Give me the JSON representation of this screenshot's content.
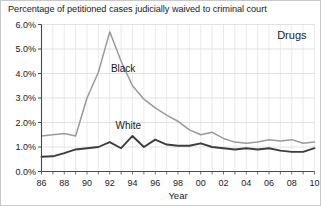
{
  "chart_data": {
    "type": "line",
    "title": "Percentage of petitioned cases judicially waived to criminal court",
    "panel_label": "Drugs",
    "xlabel": "Year",
    "ylabel": "",
    "xlim": [
      1986,
      2010
    ],
    "ylim": [
      0.0,
      6.0
    ],
    "ytick_values": [
      0.0,
      1.0,
      2.0,
      3.0,
      4.0,
      5.0,
      6.0
    ],
    "ytick_labels": [
      "0.0%",
      "1.0%",
      "2.0%",
      "3.0%",
      "4.0%",
      "5.0%",
      "6.0%"
    ],
    "xtick_values": [
      1986,
      1988,
      1990,
      1992,
      1994,
      1996,
      1998,
      2000,
      2002,
      2004,
      2006,
      2008,
      2010
    ],
    "xtick_labels": [
      "86",
      "88",
      "90",
      "92",
      "94",
      "96",
      "98",
      "00",
      "02",
      "04",
      "06",
      "08",
      "10"
    ],
    "minor_xticks_every": 1,
    "grid": true,
    "legend": "inline-annotations",
    "x": [
      1986,
      1987,
      1988,
      1989,
      1990,
      1991,
      1992,
      1993,
      1994,
      1995,
      1996,
      1997,
      1998,
      1999,
      2000,
      2001,
      2002,
      2003,
      2004,
      2005,
      2006,
      2007,
      2008,
      2009,
      2010
    ],
    "series": [
      {
        "name": "Black",
        "color": "#9a9a9a",
        "label_x": 1992.1,
        "label_y": 4.05,
        "values": [
          1.45,
          1.5,
          1.55,
          1.45,
          3.0,
          4.05,
          5.7,
          4.5,
          3.5,
          2.95,
          2.6,
          2.3,
          2.05,
          1.7,
          1.5,
          1.6,
          1.35,
          1.2,
          1.15,
          1.2,
          1.3,
          1.25,
          1.3,
          1.15,
          1.2
        ]
      },
      {
        "name": "White",
        "color": "#3d3d3d",
        "label_x": 1992.5,
        "label_y": 1.72,
        "values": [
          0.6,
          0.62,
          0.75,
          0.9,
          0.95,
          1.0,
          1.2,
          0.95,
          1.45,
          1.0,
          1.3,
          1.1,
          1.05,
          1.05,
          1.15,
          1.0,
          0.95,
          0.9,
          0.95,
          0.9,
          0.95,
          0.85,
          0.8,
          0.8,
          0.95
        ]
      }
    ]
  }
}
